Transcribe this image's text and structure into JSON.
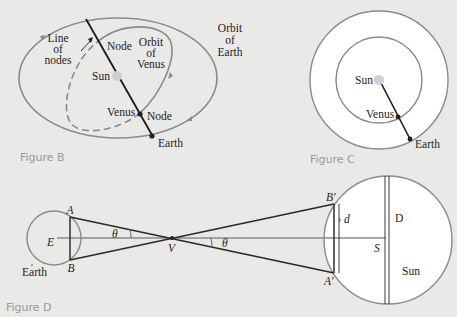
{
  "figure_b": {
    "caption": "Figure B",
    "labels": {
      "line_of_nodes_1": "Line",
      "line_of_nodes_2": "of",
      "line_of_nodes_3": "nodes",
      "node_top": "Node",
      "orbit_venus_1": "Orbit",
      "orbit_venus_2": "of",
      "orbit_venus_3": "Venus",
      "orbit_earth_1": "Orbit",
      "orbit_earth_2": "of",
      "orbit_earth_3": "Earth",
      "sun": "Sun",
      "venus": "Venus",
      "node_bottom": "Node",
      "earth": "Earth"
    }
  },
  "figure_c": {
    "caption": "Figure C",
    "labels": {
      "sun": "Sun",
      "venus": "Venus",
      "earth": "Earth"
    }
  },
  "figure_d": {
    "caption": "Figure D",
    "labels": {
      "A": "A",
      "B": "B",
      "E": "E",
      "earth": "Earth",
      "theta_left": "θ",
      "V": "V",
      "theta_right": "θ",
      "B_prime": "B′",
      "A_prime": "A′",
      "d": "d",
      "D": "D",
      "S": "S",
      "sun": "Sun"
    }
  },
  "colors": {
    "background": "#e9e9e7",
    "orbit_line": "#8a8a8a",
    "dark_line": "#2a2a2a",
    "sun_fill": "#cfcfcf",
    "caption": "#9a9a9a"
  }
}
